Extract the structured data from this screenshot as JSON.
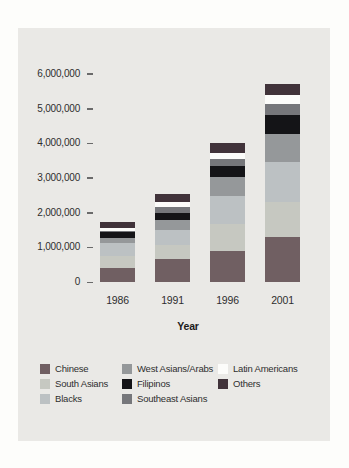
{
  "page": {
    "background": "#fdfdfb",
    "panel_background": "#eae9e6"
  },
  "chart_data": {
    "type": "bar",
    "stacked": true,
    "title": "",
    "xlabel": "Year",
    "ylabel": "",
    "categories": [
      "1986",
      "1991",
      "1996",
      "2001"
    ],
    "y_ticks": [
      "0",
      "1,000,000",
      "2,000,000",
      "3,000,000",
      "4,000,000",
      "5,000,000",
      "6,000,000"
    ],
    "ylim": [
      0,
      6000000
    ],
    "grid": false,
    "legend_position": "bottom",
    "series": [
      {
        "name": "Chinese",
        "color": "#705f62",
        "values": [
          400000,
          650000,
          900000,
          1300000
        ]
      },
      {
        "name": "South Asians",
        "color": "#c6c8c1",
        "values": [
          350000,
          430000,
          780000,
          1000000
        ]
      },
      {
        "name": "Blacks",
        "color": "#bcc1c3",
        "values": [
          360000,
          430000,
          800000,
          1150000
        ]
      },
      {
        "name": "West Asians/Arabs",
        "color": "#95989a",
        "values": [
          160000,
          290000,
          550000,
          820000
        ]
      },
      {
        "name": "Filipinos",
        "color": "#141417",
        "values": [
          160000,
          190000,
          320000,
          530000
        ]
      },
      {
        "name": "Southeast Asians",
        "color": "#76777b",
        "values": [
          40000,
          170000,
          190000,
          340000
        ]
      },
      {
        "name": "Latin Americans",
        "color": "#fcfcfa",
        "values": [
          90000,
          140000,
          190000,
          260000
        ]
      },
      {
        "name": "Others",
        "color": "#41333a",
        "values": [
          160000,
          230000,
          290000,
          320000
        ]
      }
    ],
    "legend_columns": [
      [
        "Chinese",
        "South Asians",
        "Blacks"
      ],
      [
        "West Asians/Arabs",
        "Filipinos",
        "Southeast Asians"
      ],
      [
        "Latin Americans",
        "Others"
      ]
    ]
  }
}
